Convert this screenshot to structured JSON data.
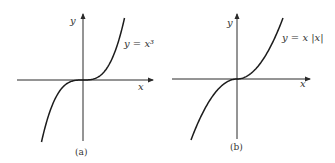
{
  "chart_data": [
    {
      "type": "line",
      "panel": "(a)",
      "equation_label": "y = x³",
      "function": "cube",
      "xlabel": "x",
      "ylabel": "y",
      "xlim": [
        -1.0,
        1.0
      ],
      "ylim": [
        -1.0,
        1.0
      ],
      "grid": false,
      "ticks": "none"
    },
    {
      "type": "line",
      "panel": "(b)",
      "equation_label": "y = x |x|",
      "function": "x_abs_x",
      "xlabel": "x",
      "ylabel": "y",
      "xlim": [
        -1.0,
        1.0
      ],
      "ylim": [
        -1.0,
        1.0
      ],
      "grid": false,
      "ticks": "none"
    }
  ]
}
